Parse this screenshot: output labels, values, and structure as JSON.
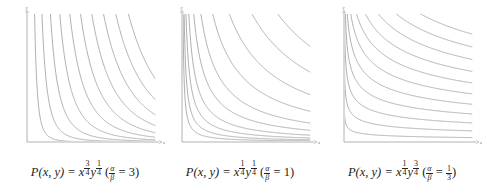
{
  "chart_data": [
    {
      "type": "line",
      "title": "Level curves of P(x, y) = x^(3/4) y^(1/4)",
      "caption": {
        "lhs": "P(x, y) = x",
        "exp_x_num": "3",
        "exp_x_den": "4",
        "exp_y_num": "1",
        "exp_y_den": "4",
        "ratio_num": "α",
        "ratio_den": "β",
        "ratio_val": "3"
      },
      "xlabel": "x",
      "ylabel": "y",
      "grid": false,
      "alpha": 0.75,
      "beta": 0.25,
      "levels": [
        0.12,
        0.2,
        0.28,
        0.36,
        0.44,
        0.52,
        0.6,
        0.68,
        0.76,
        0.84
      ],
      "xlim": [
        0,
        1
      ],
      "ylim": [
        0,
        1
      ]
    },
    {
      "type": "line",
      "title": "Level curves of P(x, y) = x^(1/4) y^(1/4)",
      "caption": {
        "lhs": "P(x, y) = x",
        "exp_x_num": "1",
        "exp_x_den": "4",
        "exp_y_num": "1",
        "exp_y_den": "4",
        "ratio_num": "α",
        "ratio_den": "β",
        "ratio_val": "1"
      },
      "xlabel": "x",
      "ylabel": "y",
      "grid": false,
      "alpha": 0.25,
      "beta": 0.25,
      "levels": [
        0.3,
        0.36,
        0.42,
        0.48,
        0.55,
        0.62,
        0.7,
        0.78,
        0.86,
        0.93
      ],
      "xlim": [
        0,
        1
      ],
      "ylim": [
        0,
        1
      ]
    },
    {
      "type": "line",
      "title": "Level curves of P(x, y) = x^(1/4) y^(3/4)",
      "caption": {
        "lhs": "P(x, y) = x",
        "exp_x_num": "1",
        "exp_x_den": "4",
        "exp_y_num": "3",
        "exp_y_den": "4",
        "ratio_num": "α",
        "ratio_den": "β",
        "ratio_val_num": "1",
        "ratio_val_den": "3"
      },
      "xlabel": "x",
      "ylabel": "y",
      "grid": false,
      "alpha": 0.25,
      "beta": 0.75,
      "levels": [
        0.08,
        0.16,
        0.24,
        0.32,
        0.4,
        0.48,
        0.56,
        0.64,
        0.72,
        0.8,
        0.88
      ],
      "xlim": [
        0,
        1
      ],
      "ylim": [
        0,
        1
      ]
    }
  ],
  "colors": {
    "curve": "#9a9a9a",
    "axis": "#a0a0a0",
    "text": "#222222"
  }
}
